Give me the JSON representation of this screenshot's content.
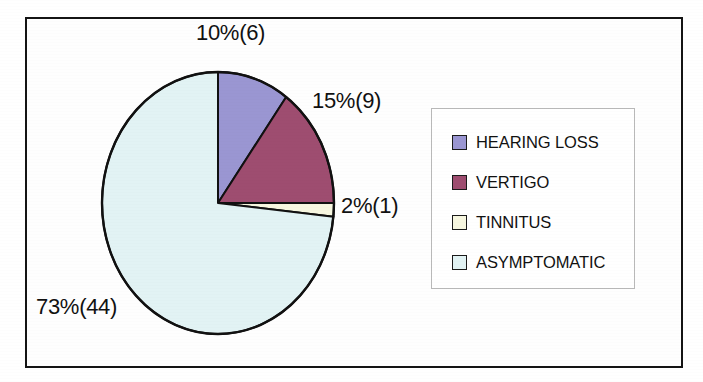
{
  "chart_data": {
    "type": "pie",
    "title": "",
    "subtitle": "",
    "xlabel": "",
    "ylabel": "",
    "grid": false,
    "legend_position": "right",
    "start_angle_deg": 0,
    "direction": "clockwise",
    "categories": [
      "HEARING LOSS",
      "VERTIGO",
      "TINNITUS",
      "ASYMPTOMATIC"
    ],
    "values": [
      6,
      9,
      1,
      44
    ],
    "percents": [
      10,
      15,
      2,
      73
    ],
    "total": 60,
    "colors": [
      "#9a96d2",
      "#9e4d70",
      "#f7f7e0",
      "#e2f3f4"
    ],
    "data_labels": [
      "10%(6)",
      "15%(9)",
      "2%(1)",
      "73%(44)"
    ],
    "slices": [
      {
        "label": "HEARING LOSS",
        "value": 6,
        "percent": 10,
        "data_label": "10%(6)",
        "color": "#9a96d2"
      },
      {
        "label": "VERTIGO",
        "value": 9,
        "percent": 15,
        "data_label": "15%(9)",
        "color": "#9e4d70"
      },
      {
        "label": "TINNITUS",
        "value": 1,
        "percent": 2,
        "data_label": "2%(1)",
        "color": "#f7f7e0"
      },
      {
        "label": "ASYMPTOMATIC",
        "value": 44,
        "percent": 73,
        "data_label": "73%(44)",
        "color": "#e2f3f4"
      }
    ]
  },
  "labels": {
    "hearing_loss": "10%(6)",
    "vertigo": "15%(9)",
    "tinnitus": "2%(1)",
    "asymptomatic": "73%(44)"
  },
  "legend": {
    "items": [
      {
        "label": "HEARING LOSS",
        "color": "#9a96d2"
      },
      {
        "label": "VERTIGO",
        "color": "#9e4d70"
      },
      {
        "label": "TINNITUS",
        "color": "#f7f7e0"
      },
      {
        "label": "ASYMPTOMATIC",
        "color": "#e2f3f4"
      }
    ]
  },
  "style": {
    "slice_outline": "#111111",
    "frame_border": "#141414",
    "legend_border": "#b9b9b9",
    "text_color": "#111111",
    "background": "#ffffff"
  }
}
